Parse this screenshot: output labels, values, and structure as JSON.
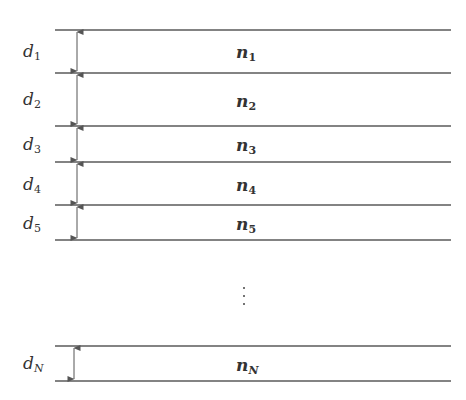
{
  "diagram": {
    "type": "layered-stack",
    "line_color": "#5a5a5a",
    "layers": [
      {
        "thickness_label": "d",
        "thickness_sub": "1",
        "index_label": "n",
        "index_sub": "1",
        "top": 30,
        "bottom": 73
      },
      {
        "thickness_label": "d",
        "thickness_sub": "2",
        "index_label": "n",
        "index_sub": "2",
        "top": 73,
        "bottom": 126
      },
      {
        "thickness_label": "d",
        "thickness_sub": "3",
        "index_label": "n",
        "index_sub": "3",
        "top": 126,
        "bottom": 162
      },
      {
        "thickness_label": "d",
        "thickness_sub": "4",
        "index_label": "n",
        "index_sub": "4",
        "top": 162,
        "bottom": 205
      },
      {
        "thickness_label": "d",
        "thickness_sub": "5",
        "index_label": "n",
        "index_sub": "5",
        "top": 205,
        "bottom": 240
      }
    ],
    "ellipsis": "⋮",
    "last_layer": {
      "thickness_label": "d",
      "thickness_sub": "N",
      "index_label": "n",
      "index_sub": "N",
      "top": 346,
      "bottom": 381
    }
  }
}
